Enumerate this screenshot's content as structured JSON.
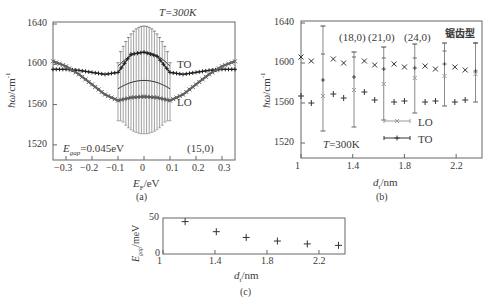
{
  "figure": {
    "panels": [
      "(a)",
      "(b)",
      "(c)"
    ]
  },
  "panel_a": {
    "caption": "(a)",
    "ylabel": "ħω/cm⁻¹",
    "xlabel": "E_F/eV",
    "xlabel_main": "E",
    "xlabel_sub": "F",
    "xlabel_unit": "/eV",
    "annotation_T": "T=300K",
    "annotation_gap_main": "E",
    "annotation_gap_sub": "gap",
    "annotation_gap_value": "=0.045eV",
    "annotation_tube": "(15,0)",
    "label_TO": "TO",
    "label_LO": "LO",
    "yticks": [
      "1640",
      "1600",
      "1560",
      "1520"
    ],
    "xticks": [
      "-0.3",
      "-0.2",
      "-0.1",
      "0",
      "0.1",
      "0.2",
      "0.3"
    ]
  },
  "panel_b": {
    "caption": "(b)",
    "ylabel": "ħω/cm⁻¹",
    "xlabel_main": "d",
    "xlabel_sub": "t",
    "xlabel_unit": "/nm",
    "annotation_T": "T=300K",
    "annotation_type": "锯齿型",
    "tube_labels": [
      "(18,0)",
      "(21,0)",
      "(24,0)"
    ],
    "legend": [
      "LO",
      "TO"
    ],
    "yticks": [
      "1640",
      "1600",
      "1560",
      "1520"
    ],
    "xticks": [
      "1",
      "1.4",
      "1.8",
      "2.2"
    ]
  },
  "panel_c": {
    "caption": "(c)",
    "ylabel_main": "E",
    "ylabel_sub": "gap",
    "ylabel_unit": "/meV",
    "xlabel_main": "d",
    "xlabel_sub": "t",
    "xlabel_unit": "/nm",
    "yticks": [
      "50",
      "0"
    ],
    "xticks": [
      "1",
      "1.4",
      "1.8",
      "2.2"
    ]
  },
  "chart_data": [
    {
      "type": "line",
      "title": "(a) Phonon frequency vs Fermi energy, (15,0) tube",
      "xlabel": "E_F/eV",
      "ylabel": "ħω/cm⁻¹",
      "xlim": [
        -0.35,
        0.35
      ],
      "ylim": [
        1505,
        1642
      ],
      "annotations": [
        "T=300K",
        "E_gap=0.045eV",
        "(15,0)",
        "TO",
        "LO"
      ],
      "x": [
        -0.35,
        -0.3,
        -0.25,
        -0.2,
        -0.15,
        -0.1,
        -0.05,
        0,
        0.05,
        0.1,
        0.15,
        0.2,
        0.25,
        0.3,
        0.35
      ],
      "series": [
        {
          "name": "TO",
          "values": [
            1595,
            1595,
            1594,
            1592,
            1590,
            1592,
            1610,
            1612,
            1608,
            1592,
            1590,
            1592,
            1594,
            1595,
            1595
          ]
        },
        {
          "name": "LO",
          "values": [
            1603,
            1598,
            1590,
            1580,
            1570,
            1564,
            1567,
            1568,
            1567,
            1564,
            1570,
            1580,
            1590,
            1598,
            1603
          ]
        }
      ],
      "error_bars": {
        "x_range": [
          -0.1,
          0.1
        ],
        "upper_max": 1638,
        "lower_min": 1531
      }
    },
    {
      "type": "scatter",
      "title": "(b) 锯齿型",
      "xlabel": "d_t/nm",
      "ylabel": "ħω/cm⁻¹",
      "xlim": [
        1,
        2.4
      ],
      "ylim": [
        1505,
        1642
      ],
      "legend": [
        "LO",
        "TO"
      ],
      "annotations": [
        "T=300K",
        "(18,0)",
        "(21,0)",
        "(24,0)",
        "锯齿型"
      ],
      "series": [
        {
          "name": "LO (×)",
          "x": [
            1.0,
            1.08,
            1.25,
            1.33,
            1.49,
            1.57,
            1.72,
            1.8,
            1.96,
            2.04,
            2.19,
            2.27
          ],
          "values": [
            1606,
            1602,
            1604,
            1600,
            1602,
            1598,
            1599,
            1596,
            1597,
            1594,
            1596,
            1593
          ]
        },
        {
          "name": "TO (+)",
          "x": [
            1.0,
            1.08,
            1.25,
            1.33,
            1.49,
            1.57,
            1.72,
            1.8,
            1.96,
            2.04,
            2.19,
            2.27
          ],
          "values": [
            1567,
            1560,
            1569,
            1565,
            1571,
            1563,
            1561,
            1562,
            1561,
            1562,
            1561,
            1563
          ]
        },
        {
          "name": "LO err",
          "x": [
            1.17,
            1.41,
            1.64,
            1.88,
            2.11,
            2.35
          ],
          "values": [
            1567,
            1573,
            1579,
            1585,
            1587,
            1589
          ],
          "lower": [
            1532,
            1536,
            1543,
            1550,
            1557,
            1561
          ],
          "upper": [
            1609,
            1606,
            1605,
            1605,
            1612,
            1620
          ]
        },
        {
          "name": "TO err",
          "x": [
            1.17,
            1.41,
            1.64,
            1.88,
            2.11,
            2.35
          ],
          "values": [
            1583,
            1586,
            1594,
            1595,
            1599,
            1592
          ],
          "lower": [
            1532,
            1536,
            1543,
            1550,
            1557,
            1561
          ],
          "upper": [
            1637,
            1611,
            1616,
            1619,
            1620,
            1620
          ]
        }
      ]
    },
    {
      "type": "scatter",
      "title": "(c)",
      "xlabel": "d_t/nm",
      "ylabel": "E_gap/meV",
      "xlim": [
        1,
        2.4
      ],
      "ylim": [
        0,
        50
      ],
      "x": [
        1.17,
        1.41,
        1.64,
        1.88,
        2.11,
        2.35
      ],
      "values": [
        45,
        31,
        23,
        18,
        14,
        12
      ]
    }
  ]
}
